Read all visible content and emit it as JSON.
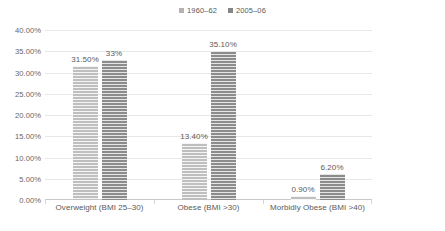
{
  "chart_data": {
    "type": "bar",
    "title": "",
    "subtitle": "",
    "xlabel": "",
    "ylabel": "",
    "categories": [
      "Overweight (BMI 25–30)",
      "Obese (BMI >30)",
      "Morbidly Obese (BMI >40)"
    ],
    "series": [
      {
        "name": "1960–62",
        "color": "#bfbfbf",
        "values": [
          31.5,
          13.4,
          0.9
        ],
        "labels": [
          "31.50%",
          "13.40%",
          "0.90%"
        ]
      },
      {
        "name": "2005–06",
        "color": "#8c8c8c",
        "values": [
          33.0,
          35.1,
          6.2
        ],
        "labels": [
          "33%",
          "35.10%",
          "6.20%"
        ]
      }
    ],
    "ylim": [
      0,
      40
    ],
    "ytick_values": [
      0,
      5,
      10,
      15,
      20,
      25,
      30,
      35,
      40
    ],
    "ytick_labels": [
      "0.00%",
      "5.00%",
      "10.00%",
      "15.00%",
      "20.00%",
      "25.00%",
      "30.00%",
      "35.00%",
      "40.00%"
    ],
    "grid": true,
    "legend_position": "top-center"
  },
  "legend": {
    "entries": [
      {
        "label": "1960–62"
      },
      {
        "label": "2005–06"
      }
    ]
  },
  "footer": {
    "clipped_text": " "
  }
}
